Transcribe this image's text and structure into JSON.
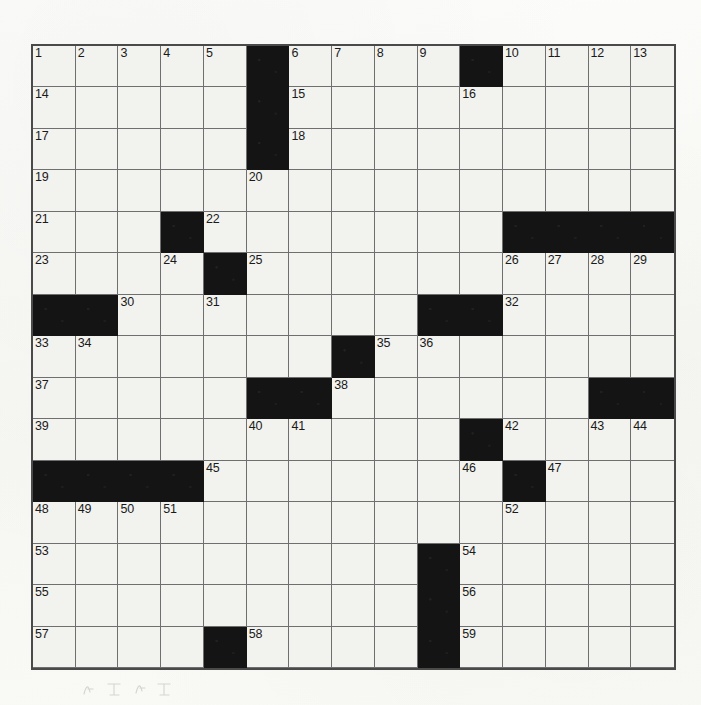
{
  "document": {
    "type": "crossword-puzzle-grid",
    "description": "Scanned blank 15x15 crossword puzzle grid with numbered squares",
    "rows": 15,
    "columns": 15
  },
  "colors": {
    "paper": "#fbfbf9",
    "cell_fill": "#f2f2ef",
    "block_fill": "#141414",
    "grid_line": "#6f6f6f",
    "border": "#4a4a4a",
    "number_text": "#1a1a1a"
  },
  "grid": {
    "blocks": [
      [
        0,
        5
      ],
      [
        0,
        10
      ],
      [
        1,
        5
      ],
      [
        2,
        5
      ],
      [
        4,
        3
      ],
      [
        4,
        11
      ],
      [
        4,
        12
      ],
      [
        4,
        13
      ],
      [
        4,
        14
      ],
      [
        5,
        4
      ],
      [
        6,
        0
      ],
      [
        6,
        1
      ],
      [
        6,
        9
      ],
      [
        6,
        10
      ],
      [
        7,
        7
      ],
      [
        8,
        5
      ],
      [
        8,
        6
      ],
      [
        8,
        13
      ],
      [
        8,
        14
      ],
      [
        9,
        10
      ],
      [
        10,
        0
      ],
      [
        10,
        1
      ],
      [
        10,
        2
      ],
      [
        10,
        3
      ],
      [
        10,
        11
      ],
      [
        12,
        9
      ],
      [
        13,
        9
      ],
      [
        14,
        4
      ],
      [
        14,
        9
      ]
    ],
    "numbers": [
      {
        "row": 0,
        "col": 0,
        "n": "1"
      },
      {
        "row": 0,
        "col": 1,
        "n": "2"
      },
      {
        "row": 0,
        "col": 2,
        "n": "3"
      },
      {
        "row": 0,
        "col": 3,
        "n": "4"
      },
      {
        "row": 0,
        "col": 4,
        "n": "5"
      },
      {
        "row": 0,
        "col": 6,
        "n": "6"
      },
      {
        "row": 0,
        "col": 7,
        "n": "7"
      },
      {
        "row": 0,
        "col": 8,
        "n": "8"
      },
      {
        "row": 0,
        "col": 9,
        "n": "9"
      },
      {
        "row": 0,
        "col": 11,
        "n": "10"
      },
      {
        "row": 0,
        "col": 12,
        "n": "11"
      },
      {
        "row": 0,
        "col": 13,
        "n": "12"
      },
      {
        "row": 0,
        "col": 14,
        "n": "13"
      },
      {
        "row": 1,
        "col": 0,
        "n": "14"
      },
      {
        "row": 1,
        "col": 6,
        "n": "15"
      },
      {
        "row": 1,
        "col": 10,
        "n": "16"
      },
      {
        "row": 2,
        "col": 0,
        "n": "17"
      },
      {
        "row": 2,
        "col": 6,
        "n": "18"
      },
      {
        "row": 3,
        "col": 0,
        "n": "19"
      },
      {
        "row": 3,
        "col": 5,
        "n": "20"
      },
      {
        "row": 4,
        "col": 0,
        "n": "21"
      },
      {
        "row": 4,
        "col": 4,
        "n": "22"
      },
      {
        "row": 5,
        "col": 0,
        "n": "23"
      },
      {
        "row": 5,
        "col": 3,
        "n": "24"
      },
      {
        "row": 5,
        "col": 5,
        "n": "25"
      },
      {
        "row": 5,
        "col": 11,
        "n": "26"
      },
      {
        "row": 5,
        "col": 12,
        "n": "27"
      },
      {
        "row": 5,
        "col": 13,
        "n": "28"
      },
      {
        "row": 5,
        "col": 14,
        "n": "29"
      },
      {
        "row": 6,
        "col": 2,
        "n": "30"
      },
      {
        "row": 6,
        "col": 4,
        "n": "31"
      },
      {
        "row": 6,
        "col": 11,
        "n": "32"
      },
      {
        "row": 7,
        "col": 0,
        "n": "33"
      },
      {
        "row": 7,
        "col": 1,
        "n": "34"
      },
      {
        "row": 7,
        "col": 8,
        "n": "35"
      },
      {
        "row": 7,
        "col": 9,
        "n": "36"
      },
      {
        "row": 8,
        "col": 0,
        "n": "37"
      },
      {
        "row": 8,
        "col": 7,
        "n": "38"
      },
      {
        "row": 9,
        "col": 0,
        "n": "39"
      },
      {
        "row": 9,
        "col": 5,
        "n": "40"
      },
      {
        "row": 9,
        "col": 6,
        "n": "41"
      },
      {
        "row": 9,
        "col": 11,
        "n": "42"
      },
      {
        "row": 9,
        "col": 13,
        "n": "43"
      },
      {
        "row": 9,
        "col": 14,
        "n": "44"
      },
      {
        "row": 10,
        "col": 4,
        "n": "45"
      },
      {
        "row": 10,
        "col": 10,
        "n": "46"
      },
      {
        "row": 10,
        "col": 12,
        "n": "47"
      },
      {
        "row": 11,
        "col": 0,
        "n": "48"
      },
      {
        "row": 11,
        "col": 1,
        "n": "49"
      },
      {
        "row": 11,
        "col": 2,
        "n": "50"
      },
      {
        "row": 11,
        "col": 3,
        "n": "51"
      },
      {
        "row": 11,
        "col": 11,
        "n": "52"
      },
      {
        "row": 12,
        "col": 0,
        "n": "53"
      },
      {
        "row": 12,
        "col": 10,
        "n": "54"
      },
      {
        "row": 13,
        "col": 0,
        "n": "55"
      },
      {
        "row": 13,
        "col": 10,
        "n": "56"
      },
      {
        "row": 14,
        "col": 0,
        "n": "57"
      },
      {
        "row": 14,
        "col": 5,
        "n": "58"
      },
      {
        "row": 14,
        "col": 10,
        "n": "59"
      }
    ]
  },
  "annotations": {
    "pencil_marks_present": true,
    "pencil_marks_location": "below-grid-left"
  }
}
